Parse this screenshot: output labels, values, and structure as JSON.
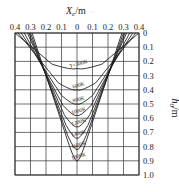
{
  "chart_data": {
    "type": "line",
    "title": "",
    "xlabel": "X_e/m",
    "ylabel": "h_0/m",
    "x_ticks": [
      "0.4",
      "0.3",
      "0.2",
      "0.1",
      "0",
      "0.1",
      "0.2",
      "0.3",
      "0.4"
    ],
    "x_tick_values": [
      -0.4,
      -0.3,
      -0.2,
      -0.1,
      0,
      0.1,
      0.2,
      0.3,
      0.4
    ],
    "y_ticks": [
      "0",
      "0.1",
      "0.2",
      "0.3",
      "0.4",
      "0.5",
      "0.6",
      "0.7",
      "0.8",
      "0.9",
      "1.0"
    ],
    "xlim": [
      -0.4,
      0.4
    ],
    "ylim": [
      0,
      1.0
    ],
    "y_inverted": true,
    "x_axis_position": "top",
    "y_axis_position": "right",
    "grid": true,
    "curve_label_prefix": "T=",
    "series": [
      {
        "name": "300K",
        "label": "T=300K",
        "top_half_width": 0.4,
        "bottom_depth": 0.25,
        "bottom_half_width": 0.16
      },
      {
        "name": "600K",
        "label": "600K",
        "top_half_width": 0.38,
        "bottom_depth": 0.4,
        "bottom_half_width": 0.12
      },
      {
        "name": "800K",
        "label": "800K",
        "top_half_width": 0.36,
        "bottom_depth": 0.5,
        "bottom_half_width": 0.1
      },
      {
        "name": "1000K",
        "label": "1000K",
        "top_half_width": 0.34,
        "bottom_depth": 0.58,
        "bottom_half_width": 0.09
      },
      {
        "name": "1200K",
        "label": "1200K",
        "top_half_width": 0.32,
        "bottom_depth": 0.66,
        "bottom_half_width": 0.08
      },
      {
        "name": "1400K",
        "label": "1400K",
        "top_half_width": 0.31,
        "bottom_depth": 0.74,
        "bottom_half_width": 0.07
      },
      {
        "name": "1600K",
        "label": "1600K",
        "top_half_width": 0.3,
        "bottom_depth": 0.82,
        "bottom_half_width": 0.06
      },
      {
        "name": "1800K",
        "label": "1800K",
        "top_half_width": 0.29,
        "bottom_depth": 0.9,
        "bottom_half_width": 0.05
      }
    ]
  }
}
